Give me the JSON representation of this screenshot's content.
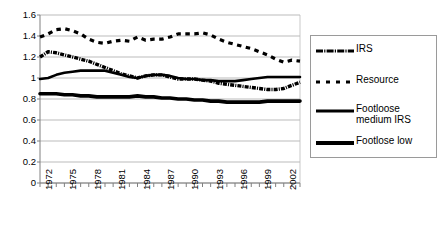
{
  "chart_data": {
    "type": "line",
    "title": "",
    "xlabel": "",
    "ylabel": "",
    "xlim": [
      1972,
      2004
    ],
    "ylim": [
      0,
      1.6
    ],
    "y_ticks": [
      "1.6",
      "1.4",
      "1.2",
      "1",
      "0.8",
      "0.6",
      "0.4",
      "0.2",
      "0"
    ],
    "y_tick_values": [
      1.6,
      1.4,
      1.2,
      1,
      0.8,
      0.6,
      0.4,
      0.2,
      0
    ],
    "x_ticks": [
      "1972",
      "1975",
      "1978",
      "1981",
      "1984",
      "1987",
      "1990",
      "1993",
      "1996",
      "1999",
      "2002"
    ],
    "x_tick_values": [
      1972,
      1975,
      1978,
      1981,
      1984,
      1987,
      1990,
      1993,
      1996,
      1999,
      2002
    ],
    "x": [
      1972,
      1973,
      1974,
      1975,
      1976,
      1977,
      1978,
      1979,
      1980,
      1981,
      1982,
      1983,
      1984,
      1985,
      1986,
      1987,
      1988,
      1989,
      1990,
      1991,
      1992,
      1993,
      1994,
      1995,
      1996,
      1997,
      1998,
      1999,
      2000,
      2001,
      2002,
      2003,
      2004
    ],
    "grid": true,
    "grid_color": "#aaaaaa",
    "legend_position": "right",
    "series": [
      {
        "name": "IRS",
        "style": "dash-dot-thick",
        "color": "#000000",
        "values": [
          1.2,
          1.25,
          1.24,
          1.22,
          1.2,
          1.18,
          1.16,
          1.13,
          1.1,
          1.07,
          1.04,
          1.02,
          1.0,
          1.02,
          1.03,
          1.03,
          1.01,
          0.99,
          0.99,
          0.99,
          0.98,
          0.97,
          0.95,
          0.94,
          0.93,
          0.92,
          0.91,
          0.9,
          0.89,
          0.89,
          0.9,
          0.93,
          0.96
        ]
      },
      {
        "name": "Resource",
        "style": "dashed",
        "color": "#000000",
        "values": [
          1.39,
          1.42,
          1.46,
          1.47,
          1.45,
          1.42,
          1.37,
          1.34,
          1.33,
          1.35,
          1.36,
          1.35,
          1.39,
          1.36,
          1.37,
          1.37,
          1.39,
          1.42,
          1.42,
          1.42,
          1.43,
          1.41,
          1.37,
          1.34,
          1.32,
          1.3,
          1.28,
          1.25,
          1.22,
          1.18,
          1.15,
          1.17,
          1.16
        ]
      },
      {
        "name": "Footloose medium IRS",
        "style": "solid",
        "color": "#000000",
        "values": [
          0.99,
          1.0,
          1.03,
          1.05,
          1.06,
          1.07,
          1.07,
          1.07,
          1.07,
          1.05,
          1.03,
          1.01,
          1.0,
          1.02,
          1.03,
          1.03,
          1.02,
          1.0,
          0.99,
          0.99,
          0.98,
          0.98,
          0.97,
          0.97,
          0.97,
          0.98,
          0.99,
          1.0,
          1.01,
          1.01,
          1.01,
          1.01,
          1.01
        ]
      },
      {
        "name": "Footlose low",
        "style": "solid-thick",
        "color": "#000000",
        "values": [
          0.85,
          0.85,
          0.85,
          0.84,
          0.84,
          0.83,
          0.83,
          0.82,
          0.82,
          0.82,
          0.82,
          0.82,
          0.83,
          0.82,
          0.82,
          0.81,
          0.81,
          0.8,
          0.8,
          0.79,
          0.79,
          0.78,
          0.78,
          0.77,
          0.77,
          0.77,
          0.77,
          0.77,
          0.78,
          0.78,
          0.78,
          0.78,
          0.78
        ]
      }
    ]
  },
  "legend": {
    "entries": [
      {
        "label": "IRS"
      },
      {
        "label": "Resource"
      },
      {
        "label": "Footloose medium IRS"
      },
      {
        "label": "Footlose low"
      }
    ]
  }
}
